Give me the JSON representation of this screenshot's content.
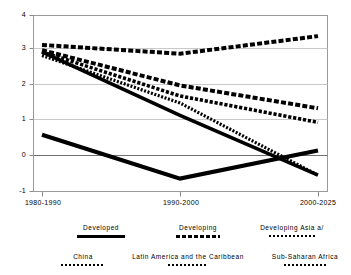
{
  "chart_data": {
    "type": "line",
    "title": "",
    "subtitle": "",
    "xlabel": "",
    "ylabel": "",
    "categories": [
      "1980-1990",
      "1990-2000",
      "2000-2025"
    ],
    "x_tick_labels": [
      "1980-1990",
      "1990-2000",
      "2000-2025"
    ],
    "y_tick_labels": [
      "4",
      "3",
      "2",
      "1",
      "0",
      "-1"
    ],
    "y_ticks": [
      4,
      3,
      2,
      1,
      0,
      -1
    ],
    "ylim": [
      -1,
      4
    ],
    "grid": true,
    "legend_position": "bottom",
    "series": [
      {
        "name": "Developed",
        "style": "solid",
        "color": "#000000",
        "values": [
          0.6,
          -0.65,
          0.15
        ]
      },
      {
        "name": "Developing",
        "style": "dashed",
        "color": "#000000",
        "values": [
          3.0,
          2.0,
          1.35
        ]
      },
      {
        "name": "Developing Asia a/",
        "style": "dotted",
        "color": "#000000",
        "values": [
          2.85,
          1.5,
          -0.55
        ]
      },
      {
        "name": "China",
        "style": "dotted",
        "color": "#000000",
        "values": [
          2.95,
          1.15,
          -0.55
        ]
      },
      {
        "name": "Latin America and the Caribbean",
        "style": "dotted",
        "color": "#000000",
        "values": [
          2.95,
          1.7,
          0.95
        ]
      },
      {
        "name": "Sub-Saharan Africa",
        "style": "dashed",
        "color": "#000000",
        "values": [
          3.15,
          2.9,
          3.4
        ]
      }
    ]
  },
  "axis": {
    "y_labels": [
      "4",
      "3",
      "2",
      "1",
      "0",
      "-1"
    ],
    "x_labels": [
      "1980-1990",
      "1990-2000",
      "2000-2025"
    ]
  },
  "legend": {
    "row1": [
      {
        "label": "Developed",
        "style": "solid"
      },
      {
        "label": "Developing",
        "style": "dashed"
      },
      {
        "label": "Developing Asia a/",
        "style": "dotted"
      }
    ],
    "row2": [
      {
        "label": "China",
        "style": "dotted"
      },
      {
        "label": "Latin America and the Caribbean",
        "style": "dotted"
      },
      {
        "label": "Sub-Saharan Africa",
        "style": "dotted"
      }
    ]
  }
}
